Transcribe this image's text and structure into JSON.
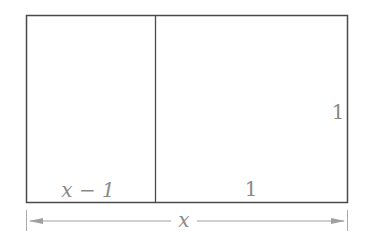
{
  "diagram": {
    "labels": {
      "left_width": "x − 1",
      "right_width": "1",
      "height": "1",
      "total_width": "x"
    },
    "colors": {
      "outline": "#4a4a4a",
      "label": "#8a8a8a",
      "dimension": "#9a9a9a"
    }
  }
}
